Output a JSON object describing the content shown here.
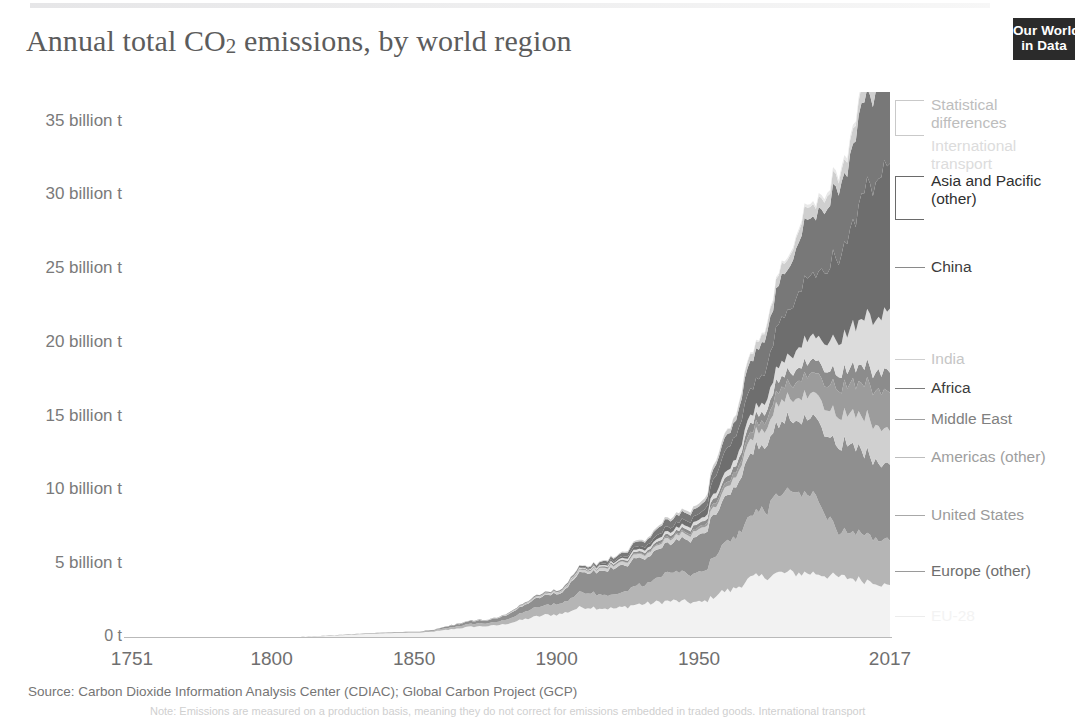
{
  "header": {
    "title_main": "Annual total CO",
    "title_sub": "2",
    "title_rest": " emissions, by world region",
    "title_full": "Annual total CO2 emissions, by world region",
    "logo_line1": "Our World",
    "logo_line2": "in Data"
  },
  "source": {
    "text": "Source: Carbon Dioxide Information Analysis Center (CDIAC); Global Carbon Project (GCP)",
    "footnote": "Note: Emissions are measured on a production basis, meaning they do not correct for emissions embedded in traded goods. International transport"
  },
  "chart_data": {
    "type": "area",
    "title": "Annual total CO2 emissions, by world region",
    "xlabel": "",
    "ylabel": "",
    "grid": false,
    "stacked": true,
    "legend_position": "right",
    "xlim": [
      1751,
      2017
    ],
    "ylim": [
      0,
      37
    ],
    "x_ticks": [
      "1751",
      "1800",
      "1850",
      "1900",
      "1950",
      "2017"
    ],
    "x_tick_values": [
      1751,
      1800,
      1850,
      1900,
      1950,
      2017
    ],
    "y_ticks": [
      "0 t",
      "5 billion t",
      "10 billion t",
      "15 billion t",
      "20 billion t",
      "25 billion t",
      "30 billion t",
      "35 billion t"
    ],
    "y_tick_values": [
      0,
      5,
      10,
      15,
      20,
      25,
      30,
      35
    ],
    "unit": "billion tonnes CO2",
    "x": [
      1751,
      1800,
      1850,
      1875,
      1900,
      1910,
      1920,
      1930,
      1940,
      1950,
      1960,
      1970,
      1980,
      1990,
      2000,
      2010,
      2017
    ],
    "series": [
      {
        "name": "EU-28",
        "color": "#f2f2f2",
        "legend_color": "#d8d8d8",
        "legend_text_color": "#f0f0f0",
        "values": [
          0.01,
          0.03,
          0.35,
          0.8,
          1.6,
          2.1,
          2.0,
          2.3,
          2.5,
          2.4,
          3.2,
          4.1,
          4.4,
          4.4,
          4.1,
          3.9,
          3.5
        ]
      },
      {
        "name": "Europe (other)",
        "color": "#b5b5b5",
        "legend_color": "#9a9a9a",
        "legend_text_color": "#6e6e6e",
        "values": [
          0.0,
          0.0,
          0.05,
          0.2,
          0.7,
          1.0,
          0.9,
          1.3,
          1.9,
          2.0,
          3.3,
          4.3,
          5.4,
          5.3,
          3.0,
          3.1,
          3.0
        ]
      },
      {
        "name": "United States",
        "color": "#8f8f8f",
        "legend_color": "#a8a8a8",
        "legend_text_color": "#9a9a9a",
        "values": [
          0.0,
          0.0,
          0.02,
          0.2,
          0.7,
          1.4,
          1.8,
          1.8,
          2.0,
          2.5,
          3.0,
          4.4,
          4.8,
          5.1,
          5.9,
          5.5,
          5.1
        ]
      },
      {
        "name": "Americas (other)",
        "color": "#d0d0d0",
        "legend_color": "#bdbdbd",
        "legend_text_color": "#9e9e9e",
        "values": [
          0.0,
          0.0,
          0.0,
          0.02,
          0.08,
          0.15,
          0.2,
          0.25,
          0.3,
          0.4,
          0.6,
          1.0,
          1.4,
          1.6,
          2.0,
          2.4,
          2.4
        ]
      },
      {
        "name": "Middle East",
        "color": "#9c9c9c",
        "legend_color": "#a0a0a0",
        "legend_text_color": "#808080",
        "values": [
          0.0,
          0.0,
          0.0,
          0.0,
          0.01,
          0.02,
          0.03,
          0.05,
          0.1,
          0.15,
          0.3,
          0.5,
          0.9,
          1.4,
          1.8,
          2.4,
          2.6
        ]
      },
      {
        "name": "Africa",
        "color": "#8c8c8c",
        "legend_color": "#7a7a7a",
        "legend_text_color": "#3b3b3b",
        "values": [
          0.0,
          0.0,
          0.0,
          0.01,
          0.03,
          0.06,
          0.1,
          0.15,
          0.2,
          0.25,
          0.4,
          0.6,
          0.8,
          0.9,
          1.0,
          1.2,
          1.4
        ]
      },
      {
        "name": "India",
        "color": "#dcdcdc",
        "legend_color": "#cfcfcf",
        "legend_text_color": "#c6c6c6",
        "values": [
          0.0,
          0.0,
          0.0,
          0.01,
          0.03,
          0.06,
          0.1,
          0.15,
          0.2,
          0.25,
          0.4,
          0.6,
          1.0,
          1.6,
          2.3,
          3.4,
          4.2
        ]
      },
      {
        "name": "China",
        "color": "#6e6e6e",
        "legend_color": "#8a8a8a",
        "legend_text_color": "#3c3c3c",
        "values": [
          0.0,
          0.0,
          0.0,
          0.0,
          0.02,
          0.05,
          0.1,
          0.2,
          0.3,
          0.4,
          1.5,
          1.8,
          3.0,
          4.3,
          5.8,
          8.9,
          10.1
        ]
      },
      {
        "name": "Asia and Pacific (other)",
        "color": "#787878",
        "legend_color": "#6a6a6a",
        "legend_text_color": "#2f2f2f",
        "values": [
          0.0,
          0.0,
          0.0,
          0.01,
          0.05,
          0.1,
          0.2,
          0.35,
          0.5,
          0.5,
          0.9,
          2.0,
          2.8,
          4.0,
          4.7,
          6.3,
          7.0
        ]
      },
      {
        "name": "International transport",
        "color": "#cfcfcf",
        "legend_color": "#d5d5d5",
        "legend_text_color": "#dcdcdc",
        "values": [
          0.0,
          0.0,
          0.0,
          0.0,
          0.02,
          0.04,
          0.06,
          0.1,
          0.15,
          0.2,
          0.3,
          0.5,
          0.7,
          0.8,
          0.9,
          1.1,
          1.2
        ]
      },
      {
        "name": "Statistical differences",
        "color": "#e8e8e8",
        "legend_color": "#c9c9c9",
        "legend_text_color": "#bdbdbd",
        "values": [
          0.0,
          0.0,
          0.0,
          0.0,
          0.0,
          0.0,
          0.0,
          0.0,
          0.0,
          0.0,
          0.05,
          0.1,
          0.15,
          0.2,
          0.25,
          0.3,
          0.35
        ]
      }
    ],
    "legend_entries": [
      {
        "label": "Statistical\ndifferences",
        "y": 96,
        "style": "bracket",
        "bracket_h": 34,
        "color": "#c9c9c9",
        "text_color": "#bdbdbd"
      },
      {
        "label": "International\ntransport",
        "y": 137,
        "style": "none",
        "bracket_h": 0,
        "color": "#d5d5d5",
        "text_color": "#dcdcdc"
      },
      {
        "label": "Asia and Pacific\n(other)",
        "y": 172,
        "style": "bracket",
        "bracket_h": 42,
        "color": "#6a6a6a",
        "text_color": "#2f2f2f"
      },
      {
        "label": "China",
        "y": 258,
        "style": "line",
        "bracket_h": 0,
        "color": "#8a8a8a",
        "text_color": "#3c3c3c"
      },
      {
        "label": "India",
        "y": 350,
        "style": "line",
        "bracket_h": 0,
        "color": "#cfcfcf",
        "text_color": "#c6c6c6"
      },
      {
        "label": "Africa",
        "y": 379,
        "style": "line",
        "bracket_h": 0,
        "color": "#7a7a7a",
        "text_color": "#3b3b3b"
      },
      {
        "label": "Middle East",
        "y": 410,
        "style": "line",
        "bracket_h": 0,
        "color": "#a0a0a0",
        "text_color": "#808080"
      },
      {
        "label": "Americas (other)",
        "y": 448,
        "style": "line",
        "bracket_h": 0,
        "color": "#bdbdbd",
        "text_color": "#9e9e9e"
      },
      {
        "label": "United States",
        "y": 506,
        "style": "line",
        "bracket_h": 0,
        "color": "#a8a8a8",
        "text_color": "#9a9a9a"
      },
      {
        "label": "Europe (other)",
        "y": 562,
        "style": "line",
        "bracket_h": 0,
        "color": "#9a9a9a",
        "text_color": "#6e6e6e"
      },
      {
        "label": "EU-28",
        "y": 607,
        "style": "line",
        "bracket_h": 0,
        "color": "#ececec",
        "text_color": "#f3f3f3"
      }
    ]
  }
}
